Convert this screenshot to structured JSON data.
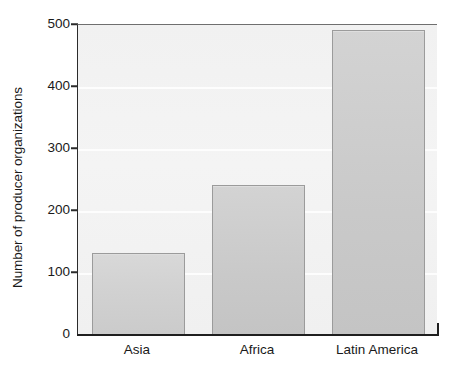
{
  "chart_data": {
    "type": "bar",
    "title": "",
    "subtitle": "",
    "xlabel": "",
    "ylabel": "Number of producer organizations",
    "categories": [
      "Asia",
      "Africa",
      "Latin America"
    ],
    "values": [
      130,
      240,
      490
    ],
    "series": [
      {
        "name": "Number of producer organizations",
        "values": [
          130,
          240,
          490
        ]
      }
    ],
    "ylim": [
      0,
      500
    ],
    "y_ticks": [
      0,
      100,
      200,
      300,
      400,
      500
    ],
    "y_tick_labels": [
      "0",
      "100",
      "200",
      "300",
      "400",
      "500"
    ],
    "grid": true,
    "grid_axis": "y",
    "legend": false,
    "legend_position": "none",
    "bar_fill_color": "#cfcfcf",
    "bar_border_color": "#9b9b9b",
    "plot_background_color": "#f2f2f2",
    "gridline_color": "#fdfdfd",
    "axis_color": "#1f1f1f",
    "text_color": "#1a1a1a",
    "figure_background_color": "#ffffff"
  }
}
